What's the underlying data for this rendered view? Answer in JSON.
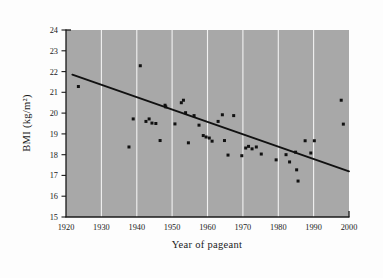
{
  "figure": {
    "background_color": "#fdfdfd",
    "plot_background_color": "#a8a8a8",
    "gridline_color": "#f2f2f2",
    "marker_color": "#111111",
    "trendline_color": "#111111"
  },
  "chart_data": {
    "type": "scatter",
    "title": "",
    "xlabel": "Year of pageant",
    "ylabel": "BMI (kg/m²)",
    "xlim": [
      1920,
      2000
    ],
    "ylim": [
      15,
      24
    ],
    "xticks": [
      1920,
      1930,
      1940,
      1950,
      1960,
      1970,
      1980,
      1990,
      2000
    ],
    "yticks": [
      15,
      16,
      17,
      18,
      19,
      20,
      21,
      22,
      23,
      24
    ],
    "xtick_labels": [
      "1920",
      "1930",
      "1940",
      "1950",
      "1960",
      "1970",
      "1980",
      "1990",
      "2000"
    ],
    "ytick_labels": [
      "15",
      "16",
      "17",
      "18",
      "19",
      "20",
      "21",
      "22",
      "23",
      "24"
    ],
    "grid": "vertical",
    "legend": "none",
    "series": [
      {
        "name": "Miss America winners",
        "marker": "square",
        "points": [
          [
            1923.5,
            21.28
          ],
          [
            1937.8,
            18.37
          ],
          [
            1939.0,
            19.72
          ],
          [
            1941.0,
            22.28
          ],
          [
            1942.6,
            19.6
          ],
          [
            1943.5,
            19.72
          ],
          [
            1944.3,
            19.52
          ],
          [
            1945.4,
            19.5
          ],
          [
            1946.6,
            18.68
          ],
          [
            1948.0,
            20.38
          ],
          [
            1948.2,
            20.3
          ],
          [
            1950.8,
            19.48
          ],
          [
            1952.6,
            20.5
          ],
          [
            1953.2,
            20.62
          ],
          [
            1953.8,
            20.02
          ],
          [
            1954.6,
            18.57
          ],
          [
            1956.2,
            19.88
          ],
          [
            1957.6,
            19.42
          ],
          [
            1958.8,
            18.92
          ],
          [
            1959.6,
            18.85
          ],
          [
            1960.5,
            18.8
          ],
          [
            1961.3,
            18.65
          ],
          [
            1963.0,
            19.6
          ],
          [
            1964.2,
            19.92
          ],
          [
            1964.8,
            18.68
          ],
          [
            1965.8,
            17.98
          ],
          [
            1967.4,
            19.88
          ],
          [
            1969.7,
            17.95
          ],
          [
            1970.8,
            18.32
          ],
          [
            1971.6,
            18.4
          ],
          [
            1972.6,
            18.28
          ],
          [
            1973.8,
            18.37
          ],
          [
            1975.2,
            18.03
          ],
          [
            1979.4,
            17.75
          ],
          [
            1982.2,
            18.0
          ],
          [
            1983.2,
            17.65
          ],
          [
            1984.9,
            18.12
          ],
          [
            1985.2,
            17.27
          ],
          [
            1985.6,
            16.73
          ],
          [
            1987.6,
            18.67
          ],
          [
            1989.2,
            18.08
          ],
          [
            1990.2,
            18.67
          ],
          [
            1997.8,
            20.62
          ],
          [
            1998.4,
            19.47
          ]
        ]
      }
    ],
    "trendline": {
      "name": "least-squares regression",
      "x_start": 1921.8,
      "y_start": 21.85,
      "x_end": 2000.0,
      "y_end": 17.2
    }
  }
}
